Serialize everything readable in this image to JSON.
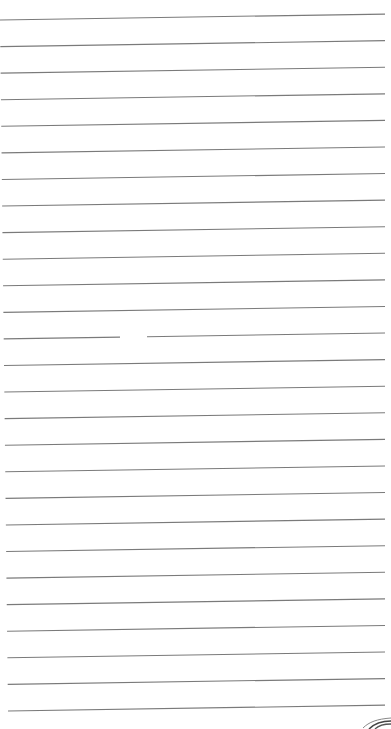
{
  "page": {
    "background_color": "#ffffff",
    "line_color": "#7a7a7a",
    "line_count": 27,
    "first_line_left_y": 20,
    "first_line_right_y": 14,
    "line_spacing": 26.58,
    "line_start_x_top": 0,
    "line_start_x_bottom": 8,
    "line_end_x": 385,
    "gaps": [
      {
        "line_index": 12,
        "from_x": 120,
        "to_x": 147
      }
    ]
  },
  "logo": {
    "icon": "swoosh-logo-icon",
    "color": "#555555"
  }
}
